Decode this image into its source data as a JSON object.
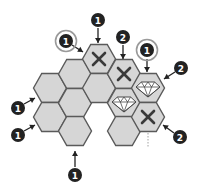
{
  "puzzle": {
    "hex_fill": "#d6d6d6",
    "hex_stroke": "#5a5a5a",
    "cells": [
      {
        "col": 0,
        "cx": 50,
        "cy": 88,
        "mark": "none"
      },
      {
        "col": 0,
        "cx": 50,
        "cy": 117,
        "mark": "none"
      },
      {
        "col": 1,
        "cx": 75,
        "cy": 74,
        "mark": "none"
      },
      {
        "col": 1,
        "cx": 75,
        "cy": 103,
        "mark": "none"
      },
      {
        "col": 1,
        "cx": 75,
        "cy": 131,
        "mark": "none"
      },
      {
        "col": 2,
        "cx": 99,
        "cy": 59,
        "mark": "x"
      },
      {
        "col": 2,
        "cx": 99,
        "cy": 88,
        "mark": "none"
      },
      {
        "col": 3,
        "cx": 124,
        "cy": 74,
        "mark": "x"
      },
      {
        "col": 3,
        "cx": 124,
        "cy": 103,
        "mark": "diamond"
      },
      {
        "col": 3,
        "cx": 124,
        "cy": 131,
        "mark": "none"
      },
      {
        "col": 4,
        "cx": 148,
        "cy": 88,
        "mark": "diamond"
      },
      {
        "col": 4,
        "cx": 148,
        "cy": 117,
        "mark": "x"
      }
    ],
    "clues": [
      {
        "value": "1",
        "circled": false,
        "cx": 98,
        "cy": 20,
        "arrow": [
          98,
          28,
          98,
          43
        ]
      },
      {
        "value": "1",
        "circled": true,
        "cx": 66,
        "cy": 41,
        "arrow": [
          72,
          45,
          83,
          52
        ]
      },
      {
        "value": "2",
        "circled": false,
        "cx": 123,
        "cy": 37,
        "arrow": [
          123,
          45,
          123,
          59
        ]
      },
      {
        "value": "1",
        "circled": true,
        "cx": 147,
        "cy": 50,
        "arrow": [
          147,
          59,
          147,
          72
        ]
      },
      {
        "value": "2",
        "circled": false,
        "cx": 181,
        "cy": 68,
        "arrow": [
          175,
          72,
          164,
          79
        ]
      },
      {
        "value": "1",
        "circled": false,
        "cx": 18,
        "cy": 108,
        "arrow": [
          24,
          104,
          35,
          98
        ]
      },
      {
        "value": "1",
        "circled": false,
        "cx": 18,
        "cy": 135,
        "arrow": [
          24,
          131,
          35,
          125
        ]
      },
      {
        "value": "1",
        "circled": false,
        "cx": 75,
        "cy": 175,
        "arrow": [
          75,
          167,
          75,
          151
        ]
      },
      {
        "value": "2",
        "circled": false,
        "cx": 180,
        "cy": 137,
        "arrow": [
          174,
          133,
          163,
          125
        ]
      }
    ],
    "guide_line": {
      "x": 148,
      "y1": 76,
      "y2": 148
    }
  }
}
